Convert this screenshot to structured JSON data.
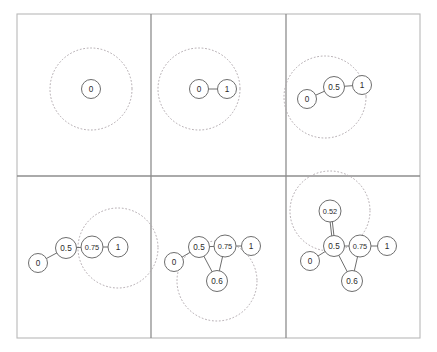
{
  "figure": {
    "title": "",
    "layout": {
      "rows": 2,
      "cols": 3,
      "frame": {
        "x": 17,
        "y": 14,
        "width": 403,
        "height": 324
      },
      "v_divider_x": [
        151,
        286
      ],
      "h_divider_y": [
        176
      ]
    },
    "styles": {
      "node_fill": "#ffffff",
      "node_stroke": "#6e6e6e",
      "edge_stroke": "#6e6e6e",
      "dotted_circle_stroke": "#b0a8ad",
      "frame_stroke": "#b9b9b9",
      "divider_stroke": "#8e8e8e",
      "label_color": "#2b2b2b"
    }
  },
  "chart_data": {
    "type": "diagram",
    "title": "",
    "subtitle": "",
    "xlabel": "",
    "ylabel": "",
    "panels": [
      {
        "index": 1,
        "position": "top-left",
        "nodes": [
          {
            "id": "n0",
            "label": "0",
            "x": 91,
            "y": 89,
            "r": 9.5
          }
        ],
        "edges": [],
        "dotted_circles": [
          {
            "cx": 91,
            "cy": 89,
            "r": 41,
            "center_node": "n0"
          }
        ]
      },
      {
        "index": 2,
        "position": "top-middle",
        "nodes": [
          {
            "id": "n0",
            "label": "0",
            "x": 199,
            "y": 89,
            "r": 9.5
          },
          {
            "id": "n1",
            "label": "1",
            "x": 227,
            "y": 89,
            "r": 9.5
          }
        ],
        "edges": [
          {
            "from": "n0",
            "to": "n1",
            "multiplicity": 1
          }
        ],
        "dotted_circles": [
          {
            "cx": 199,
            "cy": 89,
            "r": 41,
            "center_node": "n0"
          }
        ]
      },
      {
        "index": 3,
        "position": "top-right",
        "nodes": [
          {
            "id": "n0",
            "label": "0",
            "x": 307,
            "y": 99,
            "r": 9.5
          },
          {
            "id": "n05",
            "label": "0.5",
            "x": 334,
            "y": 87,
            "r": 10.5
          },
          {
            "id": "n1",
            "label": "1",
            "x": 362,
            "y": 85,
            "r": 9.5
          }
        ],
        "edges": [
          {
            "from": "n0",
            "to": "n05",
            "multiplicity": 1
          },
          {
            "from": "n05",
            "to": "n1",
            "multiplicity": 1
          }
        ],
        "dotted_circles": [
          {
            "cx": 325,
            "cy": 97,
            "r": 41,
            "center_node": "n05"
          }
        ]
      },
      {
        "index": 4,
        "position": "bottom-left",
        "nodes": [
          {
            "id": "n0",
            "label": "0",
            "x": 38,
            "y": 263,
            "r": 9.5
          },
          {
            "id": "n05",
            "label": "0.5",
            "x": 66,
            "y": 248,
            "r": 10.5
          },
          {
            "id": "n075",
            "label": "0.75",
            "x": 92,
            "y": 247,
            "r": 11
          },
          {
            "id": "n1",
            "label": "1",
            "x": 118,
            "y": 247,
            "r": 10
          }
        ],
        "edges": [
          {
            "from": "n0",
            "to": "n05",
            "multiplicity": 1
          },
          {
            "from": "n05",
            "to": "n075",
            "multiplicity": 1
          },
          {
            "from": "n075",
            "to": "n1",
            "multiplicity": 1
          }
        ],
        "dotted_circles": [
          {
            "cx": 118,
            "cy": 248,
            "r": 40,
            "center_node": "n075"
          }
        ]
      },
      {
        "index": 5,
        "position": "bottom-middle",
        "nodes": [
          {
            "id": "n0",
            "label": "0",
            "x": 174,
            "y": 262,
            "r": 9.5
          },
          {
            "id": "n05",
            "label": "0.5",
            "x": 199,
            "y": 247,
            "r": 10.5
          },
          {
            "id": "n075",
            "label": "0.75",
            "x": 225,
            "y": 246,
            "r": 11
          },
          {
            "id": "n1",
            "label": "1",
            "x": 251,
            "y": 246,
            "r": 9.5
          },
          {
            "id": "n06",
            "label": "0.6",
            "x": 217,
            "y": 281,
            "r": 10.5
          }
        ],
        "edges": [
          {
            "from": "n0",
            "to": "n05",
            "multiplicity": 1
          },
          {
            "from": "n05",
            "to": "n075",
            "multiplicity": 1
          },
          {
            "from": "n075",
            "to": "n1",
            "multiplicity": 1
          },
          {
            "from": "n05",
            "to": "n06",
            "multiplicity": 1
          },
          {
            "from": "n075",
            "to": "n06",
            "multiplicity": 1
          }
        ],
        "dotted_circles": [
          {
            "cx": 217,
            "cy": 281,
            "r": 40,
            "center_node": "n06"
          }
        ]
      },
      {
        "index": 6,
        "position": "bottom-right",
        "nodes": [
          {
            "id": "n0",
            "label": "0",
            "x": 310,
            "y": 261,
            "r": 9.5
          },
          {
            "id": "n05",
            "label": "0.5",
            "x": 334,
            "y": 246,
            "r": 10.5
          },
          {
            "id": "n075",
            "label": "0.75",
            "x": 360,
            "y": 246,
            "r": 11
          },
          {
            "id": "n1",
            "label": "1",
            "x": 387,
            "y": 246,
            "r": 9.5
          },
          {
            "id": "n06",
            "label": "0.6",
            "x": 352,
            "y": 281,
            "r": 10.5
          },
          {
            "id": "n052",
            "label": "0.52",
            "x": 330,
            "y": 211,
            "r": 11
          }
        ],
        "edges": [
          {
            "from": "n0",
            "to": "n05",
            "multiplicity": 1
          },
          {
            "from": "n05",
            "to": "n075",
            "multiplicity": 1
          },
          {
            "from": "n075",
            "to": "n1",
            "multiplicity": 1
          },
          {
            "from": "n05",
            "to": "n06",
            "multiplicity": 1
          },
          {
            "from": "n075",
            "to": "n06",
            "multiplicity": 1
          },
          {
            "from": "n052",
            "to": "n05",
            "multiplicity": 2
          }
        ],
        "dotted_circles": [
          {
            "cx": 330,
            "cy": 211,
            "r": 40,
            "center_node": "n052"
          }
        ]
      }
    ]
  }
}
